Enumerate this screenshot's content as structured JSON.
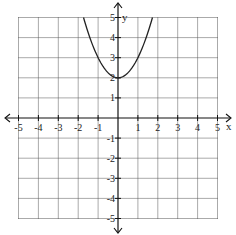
{
  "chart_data": {
    "type": "line",
    "title": "",
    "xlabel": "x",
    "ylabel": "y",
    "xlim": [
      -5,
      5
    ],
    "ylim": [
      -5,
      5
    ],
    "grid": true,
    "grid_style": "dotted",
    "x_ticks": [
      -5,
      -4,
      -3,
      -2,
      -1,
      1,
      2,
      3,
      4,
      5
    ],
    "y_ticks": [
      -5,
      -4,
      -3,
      -2,
      -1,
      1,
      2,
      3,
      4,
      5
    ],
    "series": [
      {
        "name": "y = x^2 + 2",
        "equation": "y = x^2 + 2",
        "vertex": [
          0,
          2
        ],
        "points": [
          [
            -1.73,
            5
          ],
          [
            -1,
            3
          ],
          [
            0,
            2
          ],
          [
            1,
            3
          ],
          [
            1.73,
            5
          ]
        ]
      }
    ],
    "legend": null
  },
  "labels": {
    "x_axis": "x",
    "y_axis": "y"
  },
  "colors": {
    "axis": "#111111",
    "grid": "#555555",
    "curve": "#222222"
  }
}
